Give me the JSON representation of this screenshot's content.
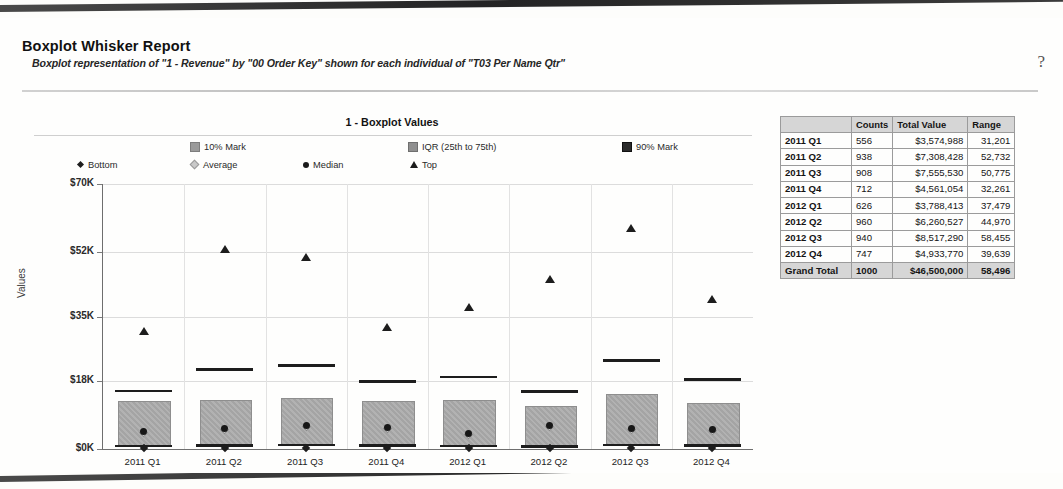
{
  "header": {
    "title": "Boxplot Whisker Report",
    "subtitle": "Boxplot representation of \"1 - Revenue\" by \"00 Order Key\" shown for each individual of \"T03 Per Name Qtr\"",
    "help_icon": "?"
  },
  "chart": {
    "title": "1 - Boxplot Values",
    "y_axis_title": "Values",
    "legend": [
      {
        "label": "Bottom",
        "marker": "diamond-dark"
      },
      {
        "label": "10% Mark",
        "marker": "square-gray"
      },
      {
        "label": "Average",
        "marker": "diamond-light"
      },
      {
        "label": "Median",
        "marker": "circle-dark"
      },
      {
        "label": "IQR (25th to 75th)",
        "marker": "square-mid"
      },
      {
        "label": "Top",
        "marker": "triangle-dark"
      },
      {
        "label": "90% Mark",
        "marker": "square-dark"
      }
    ]
  },
  "chart_data": {
    "type": "box",
    "title": "1 - Boxplot Values",
    "xlabel": "",
    "ylabel": "Values",
    "ylim": [
      0,
      70000
    ],
    "ytick_labels": [
      "$0K",
      "$18K",
      "$35K",
      "$52K",
      "$70K"
    ],
    "ytick_values": [
      0,
      18000,
      35000,
      52000,
      70000
    ],
    "grid": true,
    "legend_position": "top",
    "categories": [
      "2011 Q1",
      "2011 Q2",
      "2011 Q3",
      "2011 Q4",
      "2012 Q1",
      "2012 Q2",
      "2012 Q3",
      "2012 Q4"
    ],
    "series": [
      {
        "name": "Bottom",
        "values": [
          300,
          250,
          300,
          280,
          260,
          250,
          300,
          280
        ]
      },
      {
        "name": "10% Mark",
        "values": [
          800,
          900,
          1100,
          900,
          800,
          700,
          1100,
          900
        ]
      },
      {
        "name": "IQR 25th",
        "values": [
          1000,
          1200,
          1400,
          1200,
          1100,
          900,
          1400,
          1100
        ]
      },
      {
        "name": "Median",
        "values": [
          4700,
          5500,
          6100,
          5700,
          4200,
          6300,
          5400,
          5100
        ]
      },
      {
        "name": "Average",
        "values": [
          4700,
          5500,
          6100,
          5700,
          4200,
          6300,
          5400,
          5100
        ]
      },
      {
        "name": "IQR 75th",
        "values": [
          12600,
          12900,
          13400,
          12600,
          12900,
          11400,
          14400,
          12200
        ]
      },
      {
        "name": "90% Mark",
        "values": [
          15300,
          21000,
          22000,
          17800,
          19000,
          15200,
          23400,
          18400
        ]
      },
      {
        "name": "Top",
        "values": [
          31201,
          52732,
          50775,
          32261,
          37479,
          44970,
          58455,
          39639
        ]
      }
    ]
  },
  "table": {
    "columns": [
      "",
      "Counts",
      "Total Value",
      "Range"
    ],
    "rows": [
      {
        "label": "2011 Q1",
        "counts": "556",
        "total_value": "$3,574,988",
        "range": "31,201"
      },
      {
        "label": "2011 Q2",
        "counts": "938",
        "total_value": "$7,308,428",
        "range": "52,732"
      },
      {
        "label": "2011 Q3",
        "counts": "908",
        "total_value": "$7,555,530",
        "range": "50,775"
      },
      {
        "label": "2011 Q4",
        "counts": "712",
        "total_value": "$4,561,054",
        "range": "32,261"
      },
      {
        "label": "2012 Q1",
        "counts": "626",
        "total_value": "$3,788,413",
        "range": "37,479"
      },
      {
        "label": "2012 Q2",
        "counts": "960",
        "total_value": "$6,260,527",
        "range": "44,970"
      },
      {
        "label": "2012 Q3",
        "counts": "940",
        "total_value": "$8,517,290",
        "range": "58,455"
      },
      {
        "label": "2012 Q4",
        "counts": "747",
        "total_value": "$4,933,770",
        "range": "39,639"
      }
    ],
    "total_row": {
      "label": "Grand Total",
      "counts": "1000",
      "total_value": "$46,500,000",
      "range": "58,496"
    }
  },
  "colors": {
    "box_fill": "#a8a8a8",
    "marker_dark": "#1d1d1d",
    "grid": "#dcdcdc",
    "table_header_bg": "#d6d6d6"
  }
}
